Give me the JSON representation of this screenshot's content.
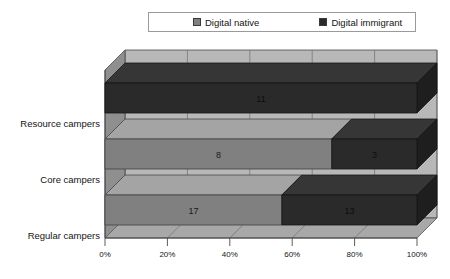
{
  "legend": {
    "position": "top-center",
    "entries": [
      {
        "label": "Digital native",
        "color": "#808080",
        "swatch_icon": "square-swatch-icon"
      },
      {
        "label": "Digital immigrant",
        "color": "#2a2a2a",
        "swatch_icon": "square-swatch-icon"
      }
    ]
  },
  "colors": {
    "digital_native": "#808080",
    "digital_immigrant": "#2a2a2a",
    "back_wall": "#b8b8b8",
    "side_wall": "#8f8f8f",
    "floor": "#a8a8a8",
    "gridline": "#6f6f6f",
    "axis": "#4a4a4a",
    "text": "#141414",
    "page_background": "#ffffff"
  },
  "axes": {
    "x": {
      "label": "",
      "ticks": [
        "0%",
        "20%",
        "40%",
        "60%",
        "80%",
        "100%"
      ],
      "tick_values": [
        0,
        20,
        40,
        60,
        80,
        100
      ],
      "min": 0,
      "max": 100,
      "grid": true
    },
    "y": {
      "label": "",
      "ticks": [
        "Regular campers",
        "Core campers",
        "Resource campers"
      ]
    }
  },
  "chart_data": {
    "type": "bar",
    "orientation": "horizontal",
    "stacked": true,
    "stack_normalized": true,
    "title": "",
    "subtitle": "",
    "xlabel": "",
    "ylabel": "",
    "xlim": [
      0,
      100
    ],
    "grid": true,
    "legend_position": "top-center",
    "categories": [
      "Resource campers",
      "Core campers",
      "Regular campers"
    ],
    "series": [
      {
        "name": "Digital native",
        "color": "#808080",
        "values": [
          0,
          8,
          17
        ]
      },
      {
        "name": "Digital immigrant",
        "color": "#2a2a2a",
        "values": [
          11,
          3,
          13
        ]
      }
    ],
    "rows": [
      {
        "category": "Resource campers",
        "segments": [
          {
            "series": "Digital native",
            "value": 0,
            "label": "",
            "percent": 0.0
          },
          {
            "series": "Digital immigrant",
            "value": 11,
            "label": "11",
            "percent": 100.0
          }
        ],
        "total": 11
      },
      {
        "category": "Core campers",
        "segments": [
          {
            "series": "Digital native",
            "value": 8,
            "label": "8",
            "percent": 72.7
          },
          {
            "series": "Digital immigrant",
            "value": 3,
            "label": "3",
            "percent": 27.3
          }
        ],
        "total": 11
      },
      {
        "category": "Regular campers",
        "segments": [
          {
            "series": "Digital native",
            "value": 17,
            "label": "17",
            "percent": 56.7
          },
          {
            "series": "Digital immigrant",
            "value": 13,
            "label": "13",
            "percent": 43.3
          }
        ],
        "total": 30
      }
    ]
  }
}
